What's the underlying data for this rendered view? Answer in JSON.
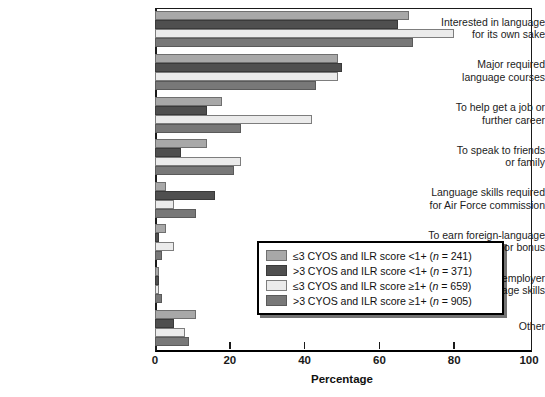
{
  "chart_data": {
    "type": "bar",
    "orientation": "horizontal",
    "title": "",
    "xlabel": "Percentage",
    "ylabel": "",
    "xlim": [
      0,
      100
    ],
    "xticks": [
      0,
      20,
      40,
      60,
      80,
      100
    ],
    "grid": false,
    "legend_position": "center-right",
    "categories": [
      "Interested in language\nfor its own sake",
      "Major required\nlanguage courses",
      "To help get a job or\nfurther career",
      "To speak to friends\nor family",
      "Language skills required\nfor Air Force commission",
      "To earn foreign-language\nproficiency pay or bonus",
      "Nonmilitary employer\nrequired language skills",
      "Other"
    ],
    "series": [
      {
        "name": "≤3 CYOS and ILR score <1+ (n = 241)",
        "color": "#a8a8a8",
        "values": [
          68,
          49,
          18,
          14,
          3,
          3,
          1,
          11
        ]
      },
      {
        "name": ">3 CYOS and ILR score <1+ (n = 371)",
        "color": "#4f4f4f",
        "values": [
          65,
          50,
          14,
          7,
          16,
          1,
          1,
          5
        ]
      },
      {
        "name": "≤3 CYOS and ILR score ≥1+ (n = 659)",
        "color": "#ebebeb",
        "values": [
          80,
          49,
          42,
          23,
          5,
          5,
          1,
          8
        ]
      },
      {
        "name": ">3 CYOS and ILR score ≥1+ (n = 905)",
        "color": "#787878",
        "values": [
          69,
          43,
          23,
          21,
          11,
          2,
          2,
          9
        ]
      }
    ]
  },
  "legend": {
    "items": [
      {
        "prefix": "≤3 CYOS and ILR score <1+ (",
        "n_label": "n",
        "n_value": " = 241)"
      },
      {
        "prefix": ">3 CYOS and ILR score <1+ (",
        "n_label": "n",
        "n_value": " = 371)"
      },
      {
        "prefix": "≤3 CYOS and ILR score ≥1+ (",
        "n_label": "n",
        "n_value": " = 659)"
      },
      {
        "prefix": ">3 CYOS and ILR score ≥1+ (",
        "n_label": "n",
        "n_value": " = 905)"
      }
    ]
  },
  "axis": {
    "x_title": "Percentage",
    "x_tick_labels": [
      "0",
      "20",
      "40",
      "60",
      "80",
      "100"
    ]
  }
}
